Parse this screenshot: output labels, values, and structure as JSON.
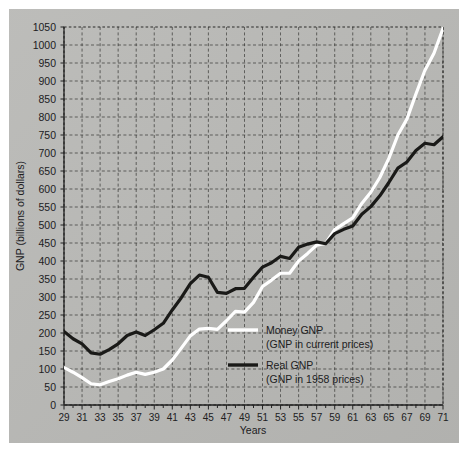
{
  "figure": {
    "background_color": "#b9b9b6",
    "page_color": "#ffffff",
    "caption": ""
  },
  "chart_data": {
    "type": "line",
    "title": "",
    "xlabel": "Years",
    "ylabel": "GNP (billions of dollars)",
    "xlim": [
      29,
      71
    ],
    "ylim": [
      0,
      1050
    ],
    "ytick_step": 50,
    "xtick_step": 2,
    "xtick_minor_step": 1,
    "grid": true,
    "grid_style": "dashed",
    "legend_position": "inside-lower-right",
    "yticks": [
      0,
      50,
      100,
      150,
      200,
      250,
      300,
      350,
      400,
      450,
      500,
      550,
      600,
      650,
      700,
      750,
      800,
      850,
      900,
      950,
      1000,
      1050
    ],
    "xticks": [
      29,
      31,
      33,
      35,
      37,
      39,
      41,
      43,
      45,
      47,
      49,
      51,
      53,
      55,
      57,
      59,
      61,
      63,
      65,
      67,
      69,
      71
    ],
    "x": [
      29,
      30,
      31,
      32,
      33,
      34,
      35,
      36,
      37,
      38,
      39,
      40,
      41,
      42,
      43,
      44,
      45,
      46,
      47,
      48,
      49,
      50,
      51,
      52,
      53,
      54,
      55,
      56,
      57,
      58,
      59,
      60,
      61,
      62,
      63,
      64,
      65,
      66,
      67,
      68,
      69,
      70,
      71
    ],
    "series": [
      {
        "name": "Money GNP",
        "sublabel": "(GNP in current prices)",
        "color": "#ffffff",
        "line_width": 3.2,
        "values": [
          104,
          91,
          76,
          59,
          56,
          65,
          73,
          83,
          91,
          85,
          91,
          100,
          125,
          158,
          192,
          211,
          213,
          210,
          234,
          260,
          258,
          285,
          329,
          347,
          366,
          366,
          400,
          421,
          444,
          449,
          487,
          504,
          520,
          560,
          591,
          632,
          685,
          750,
          794,
          864,
          930,
          977,
          1046
        ]
      },
      {
        "name": "Real GNP",
        "sublabel": "(GNP in 1958 prices)",
        "color": "#1a1a18",
        "line_width": 3.2,
        "values": [
          204,
          184,
          170,
          145,
          141,
          154,
          170,
          193,
          203,
          193,
          209,
          227,
          264,
          298,
          337,
          361,
          355,
          313,
          310,
          323,
          324,
          355,
          383,
          395,
          413,
          407,
          438,
          447,
          453,
          448,
          476,
          488,
          497,
          530,
          551,
          581,
          618,
          658,
          675,
          707,
          727,
          723,
          745
        ]
      }
    ],
    "annotations": [
      {
        "text": "Money GNP",
        "kind": "legend-entry"
      },
      {
        "text": "(GNP in current prices)",
        "kind": "legend-entry-sub"
      },
      {
        "text": "Real GNP",
        "kind": "legend-entry"
      },
      {
        "text": "(GNP in 1958 prices)",
        "kind": "legend-entry-sub"
      }
    ]
  }
}
